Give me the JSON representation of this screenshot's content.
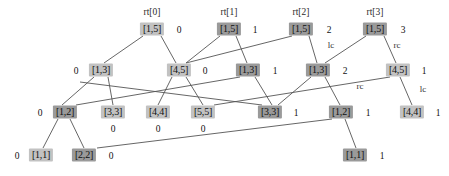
{
  "diagram": {
    "canvas": {
      "width": 449,
      "height": 176
    },
    "colors": {
      "node_light": "#c2c2c2",
      "node_dark": "#9a9a9a",
      "edge": "#555555",
      "text": "#111111",
      "background": "#ffffff"
    },
    "roots": [
      {
        "name": "rt[0]",
        "x": 152,
        "y": 12
      },
      {
        "name": "rt[1]",
        "x": 229,
        "y": 12
      },
      {
        "name": "rt[2]",
        "x": 301,
        "y": 12
      },
      {
        "name": "rt[3]",
        "x": 375,
        "y": 12
      }
    ],
    "nodes": [
      {
        "id": "n0",
        "label": "[1,5]",
        "x": 152,
        "y": 29,
        "shade": "light"
      },
      {
        "id": "n1",
        "label": "[1,5]",
        "x": 229,
        "y": 29,
        "shade": "dark"
      },
      {
        "id": "n2",
        "label": "[1,5]",
        "x": 301,
        "y": 29,
        "shade": "dark"
      },
      {
        "id": "n3",
        "label": "[1,5]",
        "x": 375,
        "y": 29,
        "shade": "dark"
      },
      {
        "id": "n4",
        "label": "[1,3]",
        "x": 101,
        "y": 70,
        "shade": "light"
      },
      {
        "id": "n5",
        "label": "[4,5]",
        "x": 179,
        "y": 70,
        "shade": "light"
      },
      {
        "id": "n6",
        "label": "[1,3]",
        "x": 248,
        "y": 70,
        "shade": "dark"
      },
      {
        "id": "n7",
        "label": "[1,3]",
        "x": 318,
        "y": 70,
        "shade": "dark"
      },
      {
        "id": "n8",
        "label": "[4,5]",
        "x": 398,
        "y": 70,
        "shade": "light"
      },
      {
        "id": "n9",
        "label": "[1,2]",
        "x": 65,
        "y": 112,
        "shade": "dark"
      },
      {
        "id": "n10",
        "label": "[3,3]",
        "x": 113,
        "y": 112,
        "shade": "light"
      },
      {
        "id": "n11",
        "label": "[4,4]",
        "x": 158,
        "y": 112,
        "shade": "light"
      },
      {
        "id": "n12",
        "label": "[5,5]",
        "x": 203,
        "y": 112,
        "shade": "light"
      },
      {
        "id": "n13",
        "label": "[3,3]",
        "x": 270,
        "y": 112,
        "shade": "dark"
      },
      {
        "id": "n14",
        "label": "[1,2]",
        "x": 341,
        "y": 112,
        "shade": "dark"
      },
      {
        "id": "n15",
        "label": "[4,4]",
        "x": 412,
        "y": 112,
        "shade": "light"
      },
      {
        "id": "n16",
        "label": "[1,1]",
        "x": 41,
        "y": 155,
        "shade": "light"
      },
      {
        "id": "n17",
        "label": "[2,2]",
        "x": 84,
        "y": 155,
        "shade": "dark"
      },
      {
        "id": "n18",
        "label": "[1,1]",
        "x": 355,
        "y": 155,
        "shade": "dark"
      }
    ],
    "value_labels": [
      {
        "text": "0",
        "x": 179,
        "y": 30
      },
      {
        "text": "1",
        "x": 255,
        "y": 30
      },
      {
        "text": "2",
        "x": 329,
        "y": 30
      },
      {
        "text": "3",
        "x": 403,
        "y": 30
      },
      {
        "text": "0",
        "x": 76,
        "y": 71
      },
      {
        "text": "0",
        "x": 205,
        "y": 71
      },
      {
        "text": "1",
        "x": 275,
        "y": 71
      },
      {
        "text": "2",
        "x": 345,
        "y": 71
      },
      {
        "text": "1",
        "x": 424,
        "y": 71
      },
      {
        "text": "0",
        "x": 40,
        "y": 113
      },
      {
        "text": "1",
        "x": 296,
        "y": 113
      },
      {
        "text": "1",
        "x": 368,
        "y": 113
      },
      {
        "text": "1",
        "x": 438,
        "y": 113
      },
      {
        "text": "0",
        "x": 113,
        "y": 129
      },
      {
        "text": "0",
        "x": 158,
        "y": 129
      },
      {
        "text": "0",
        "x": 203,
        "y": 129
      },
      {
        "text": "0",
        "x": 17,
        "y": 156
      },
      {
        "text": "0",
        "x": 111,
        "y": 156
      },
      {
        "text": "1",
        "x": 382,
        "y": 156
      }
    ],
    "edge_labels": [
      {
        "text": "lc",
        "x": 331,
        "y": 45
      },
      {
        "text": "rc",
        "x": 397,
        "y": 45
      },
      {
        "text": "rc",
        "x": 360,
        "y": 86
      },
      {
        "text": "lc",
        "x": 423,
        "y": 89
      }
    ],
    "edges": [
      {
        "from": "n0",
        "to": "n4",
        "x1": 143,
        "y1": 36,
        "x2": 104,
        "y2": 63
      },
      {
        "from": "n0",
        "to": "n5",
        "x1": 161,
        "y1": 36,
        "x2": 176,
        "y2": 63
      },
      {
        "from": "n1",
        "to": "n5",
        "x1": 220,
        "y1": 36,
        "x2": 186,
        "y2": 63
      },
      {
        "from": "n1",
        "to": "n6",
        "x1": 236,
        "y1": 36,
        "x2": 247,
        "y2": 63
      },
      {
        "from": "n2",
        "to": "n5",
        "x1": 292,
        "y1": 36,
        "x2": 186,
        "y2": 63
      },
      {
        "from": "n2",
        "to": "n7",
        "x1": 309,
        "y1": 36,
        "x2": 317,
        "y2": 63
      },
      {
        "from": "n3",
        "to": "n7",
        "x1": 366,
        "y1": 36,
        "x2": 325,
        "y2": 63
      },
      {
        "from": "n3",
        "to": "n8",
        "x1": 384,
        "y1": 36,
        "x2": 396,
        "y2": 63
      },
      {
        "from": "n4",
        "to": "n9",
        "x1": 94,
        "y1": 77,
        "x2": 62,
        "y2": 105
      },
      {
        "from": "n4",
        "to": "n10",
        "x1": 108,
        "y1": 77,
        "x2": 113,
        "y2": 105
      },
      {
        "from": "n5",
        "to": "n11",
        "x1": 172,
        "y1": 77,
        "x2": 158,
        "y2": 105
      },
      {
        "from": "n5",
        "to": "n12",
        "x1": 186,
        "y1": 77,
        "x2": 203,
        "y2": 105
      },
      {
        "from": "n6",
        "to": "n9",
        "x1": 240,
        "y1": 77,
        "x2": 76,
        "y2": 105
      },
      {
        "from": "n6",
        "to": "n13",
        "x1": 255,
        "y1": 77,
        "x2": 272,
        "y2": 105
      },
      {
        "from": "n7",
        "to": "n13",
        "x1": 311,
        "y1": 77,
        "x2": 278,
        "y2": 105
      },
      {
        "from": "n7",
        "to": "n14",
        "x1": 325,
        "y1": 77,
        "x2": 340,
        "y2": 105
      },
      {
        "from": "n8",
        "to": "n15",
        "x1": 400,
        "y1": 77,
        "x2": 412,
        "y2": 105
      },
      {
        "from": "n8",
        "to": "n12",
        "x1": 390,
        "y1": 77,
        "x2": 214,
        "y2": 105
      },
      {
        "from": "n9",
        "to": "n16",
        "x1": 58,
        "y1": 119,
        "x2": 43,
        "y2": 148
      },
      {
        "from": "n9",
        "to": "n17",
        "x1": 70,
        "y1": 119,
        "x2": 84,
        "y2": 148
      },
      {
        "from": "n14",
        "to": "n18",
        "x1": 345,
        "y1": 119,
        "x2": 356,
        "y2": 148
      },
      {
        "from": "n14",
        "to": "n17",
        "x1": 332,
        "y1": 119,
        "x2": 97,
        "y2": 148
      },
      {
        "from": "n13",
        "to": "n10",
        "x1": 262,
        "y1": 105,
        "x2": 80,
        "y2": 82
      }
    ]
  }
}
